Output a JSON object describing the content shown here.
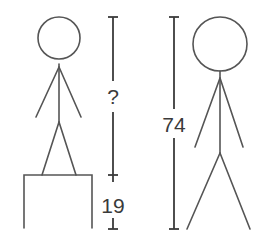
{
  "diagram": {
    "title": "",
    "left": {
      "figure": "stick-person-on-box",
      "unknown_height_label": "?",
      "box_height_label": "19"
    },
    "right": {
      "figure": "stick-person-standing",
      "height_label": "74"
    },
    "colors": {
      "stroke": "#555555",
      "dimension": "#3a3a3a",
      "background": "#ffffff"
    }
  }
}
